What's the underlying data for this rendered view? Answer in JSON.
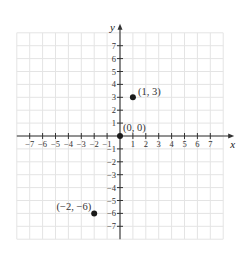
{
  "chart_data": {
    "type": "scatter",
    "title": "",
    "xlabel": "x",
    "ylabel": "y",
    "xlim": [
      -8,
      8
    ],
    "ylim": [
      -8,
      8
    ],
    "grid": true,
    "x_ticks": [
      -7,
      -6,
      -5,
      -4,
      -3,
      -2,
      -1,
      1,
      2,
      3,
      4,
      5,
      6,
      7
    ],
    "y_ticks": [
      -7,
      -6,
      -5,
      -4,
      -3,
      -2,
      -1,
      1,
      2,
      3,
      4,
      5,
      6,
      7
    ],
    "x_tick_labels": [
      "−7",
      "−6",
      "−5",
      "−4",
      "−3",
      "−2",
      "−1",
      "1",
      "2",
      "3",
      "4",
      "5",
      "6",
      "7"
    ],
    "y_tick_labels": [
      "−7",
      "−6",
      "−5",
      "−4",
      "−3",
      "−2",
      "−1",
      "1",
      "2",
      "3",
      "4",
      "5",
      "6",
      "7"
    ],
    "points": [
      {
        "x": 1,
        "y": 3,
        "label": "(1, 3)",
        "label_position": "right"
      },
      {
        "x": 0,
        "y": 0,
        "label": "(0, 0)",
        "label_position": "above-right"
      },
      {
        "x": -2,
        "y": -6,
        "label": "(−2, −6)",
        "label_position": "left"
      }
    ],
    "colors": {
      "grid": "#e4e4e4",
      "axis": "#333333",
      "point": "#1a1a1a"
    }
  },
  "layout": {
    "origin_x": 120,
    "origin_y": 136,
    "unit": 12.9
  }
}
